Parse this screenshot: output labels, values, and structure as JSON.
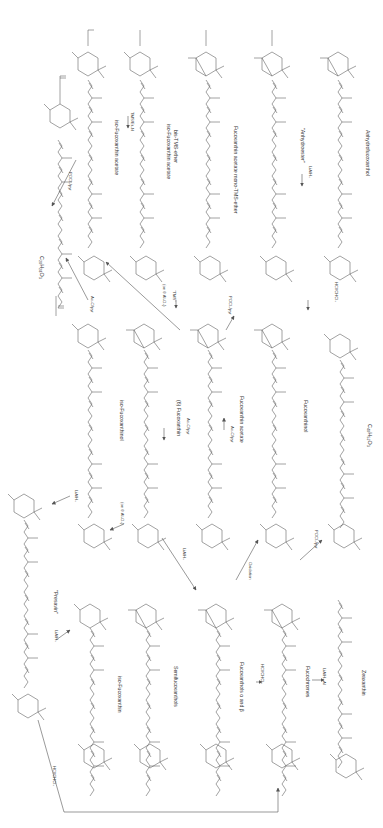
{
  "diagram": {
    "type": "reaction-scheme",
    "orientation": "rotated-90-clockwise",
    "columns": [
      {
        "x": 95,
        "compounds": [
          {
            "id": "c20h28o3",
            "name": "C20H28O3",
            "top_group": "O-C(=O)-CH3",
            "end_group": "H3C-C(=O)-O"
          },
          {
            "id": "presavin",
            "name": "\"Presavin\"",
            "substituents": [
              "OH",
              "OH",
              "OH"
            ]
          },
          {
            "id": "iso-fucoxanthin",
            "name": "iso-Fucoxanthin",
            "substituents": [
              "HO",
              "OH"
            ]
          }
        ]
      }
    ],
    "compounds": [
      {
        "id": "iso-fucoxanthin-acetate",
        "label": "iso-Fucoxanthin acetate",
        "groups": [
          "OH",
          "O-C(=O)-CH3",
          "H3C-C(=O)-O",
          "OH"
        ]
      },
      {
        "id": "iso-fucoxanthin-acetate-bis-tms",
        "label": "iso-Fucoxanthin acetate bis-TMS-ether",
        "groups": [
          "TMSO",
          "O-C(=O)-CH3",
          "H3C-C(=O)-O",
          "OTMS"
        ]
      },
      {
        "id": "fucoxanthin-acetate-mono-tms",
        "label": "Fucoxanthin acetate mono-TMS-ether",
        "groups": [
          "O-C(=O)-CH3",
          "H3C-C(=O)-O",
          "OTMS"
        ]
      },
      {
        "id": "anhydroester",
        "label": "\"Anhydroester\"",
        "groups": [
          "O-C(=O)-CH3",
          "H3C-C(=O)-O"
        ]
      },
      {
        "id": "anhydrofucoxanthol",
        "label": "Anhydrofucoxanthol",
        "groups": [
          "OH",
          "HO",
          "HO"
        ]
      },
      {
        "id": "c20h28o3",
        "label": "C20H28O3",
        "groups": [
          "O-C(=O)-CH3",
          "H3C-C(=O)-O"
        ]
      },
      {
        "id": "iso-fucoxanthinol",
        "label": "iso-Fucoxanthinol",
        "groups": [
          "OH",
          "OH",
          "H3C-C(=O)-O",
          "OH"
        ]
      },
      {
        "id": "fucoxanthin",
        "label": "(6) Fucoxanthin",
        "groups": [
          "OH",
          "H3C-C(=O)-O",
          "OH"
        ]
      },
      {
        "id": "fucoxanthin-acetate",
        "label": "Fucoxanthin acetate",
        "groups": [
          "O-C(=O)-CH3",
          "H3C-C(=O)-O",
          "OH"
        ]
      },
      {
        "id": "fucoxanthinol",
        "label": "Fucoxanthinol",
        "groups": [
          "OH",
          "H3C-C(=O)-O",
          "OH"
        ]
      },
      {
        "id": "c40h52o3",
        "label": "C40H52O3",
        "groups": [
          "OHC",
          "HO"
        ]
      },
      {
        "id": "presavin",
        "label": "\"Presavin\"",
        "groups": [
          "OH",
          "OH",
          "OH",
          "HO",
          "OH"
        ]
      },
      {
        "id": "iso-fucoxanthin",
        "label": "iso-Fucoxanthin",
        "groups": [
          "HO",
          "OH",
          "H3C-C(=O)-O",
          "OH"
        ]
      },
      {
        "id": "semifucoxanthols",
        "label": "Semifucoxanthols",
        "groups": [
          "OH",
          "HO",
          "H3C-C(=O)-O",
          "OH"
        ]
      },
      {
        "id": "fucoxanthols",
        "label": "Fucoxanthols α and β",
        "groups": [
          "OH",
          "HO",
          "HO",
          "OH"
        ]
      },
      {
        "id": "fucochromes",
        "label": "Fucochromes",
        "groups": [
          "OH",
          "HO",
          "OH"
        ]
      },
      {
        "id": "zeaxanthin",
        "label": "Zeaxanthin",
        "groups": [
          "HO",
          "OH"
        ]
      }
    ],
    "reagents": [
      {
        "id": "r1",
        "label": "POCl3/pyr",
        "from": "iso-fucoxanthin-acetate",
        "to": "c20h28o3"
      },
      {
        "id": "r2",
        "label": "Ac2O/pyr",
        "from": "iso-fucoxanthinol",
        "to": "c20h28o3"
      },
      {
        "id": "r3",
        "label": "TMS/Et3N",
        "from": "iso-fucoxanthin-acetate",
        "to": "iso-fucoxanthin-acetate-bis-tms"
      },
      {
        "id": "r4",
        "label": "Ac2O/pyr",
        "from": "fucoxanthin",
        "to": "fucoxanthin-acetate"
      },
      {
        "id": "r5",
        "label": "(on θ Al2O3)",
        "from": "fucoxanthin-acetate",
        "to": "iso-fucoxanthin-acetate"
      },
      {
        "id": "r6",
        "label": "TMS",
        "from": "fucoxanthin-acetate",
        "to": "fucoxanthin-acetate-mono-tms"
      },
      {
        "id": "r7",
        "label": "Ac2O/pyr",
        "from": "fucoxanthinol",
        "to": "fucoxanthin-acetate"
      },
      {
        "id": "r8",
        "label": "POCl3/pyr",
        "from": "fucoxanthin-acetate",
        "to": "anhydroester"
      },
      {
        "id": "r9",
        "label": "LiAlH4",
        "from": "anhydroester",
        "to": "anhydrofucoxanthol"
      },
      {
        "id": "r10",
        "label": "HCl/CHCl3",
        "from": "fucoxanthinol",
        "to": "c40h52o3"
      },
      {
        "id": "r11",
        "label": "LiAlH4",
        "from": "iso-fucoxanthinol",
        "to": "presavin"
      },
      {
        "id": "r12",
        "label": "(on θ Al2O3)",
        "from": "fucoxanthin",
        "to": "iso-fucoxanthin"
      },
      {
        "id": "r13",
        "label": "LiAlH4",
        "from": "iso-fucoxanthin",
        "to": "presavin"
      },
      {
        "id": "r14",
        "label": "LiAlH4",
        "from": "fucoxanthin",
        "to": "fucoxanthols"
      },
      {
        "id": "r15",
        "label": "Oxidation",
        "from": "fucoxanthols",
        "to": "fucoxanthinol"
      },
      {
        "id": "r16",
        "label": "POCl3/pyr",
        "from": "fucochromes",
        "to": "fucoxanthinol"
      },
      {
        "id": "r17",
        "label": "HCl/CHCl3",
        "from": "fucoxanthols",
        "to": "fucochromes"
      },
      {
        "id": "r18",
        "label": "LiAlH4,Al",
        "from": "fucochromes",
        "to": "zeaxanthin"
      },
      {
        "id": "r19",
        "label": "HCl/CHCl3",
        "from": "iso-fucoxanthin",
        "to": "fucochromes"
      }
    ],
    "labels": {
      "iso_fucoxanthin_acetate": "iso-Fucoxanthin acetate",
      "iso_fucoxanthin_acetate_bis_tms": "iso-Fucoxanthin acetate",
      "bis_tms_ether": "bis-TMS-ether",
      "fucoxanthin_acetate_mono_tms": "Fucoxanthin acetate   mono-TMS-ether",
      "anhydroester": "\"Anhydroester\"",
      "anhydrofucoxanthol": "Anhydrofucoxanthol",
      "c20h28o3": "C₂₀H₂₈O₃",
      "iso_fucoxanthinol": "iso-Fucoxanthinol",
      "fucoxanthin": "(6)  Fucoxanthin",
      "fucoxanthin_acetate": "Fucoxanthin acetate",
      "fucoxanthinol": "Fucoxanthinol",
      "c40h52o3": "C₄₀H₅₂O₃",
      "presavin": "\"Presavin\"",
      "iso_fucoxanthin": "iso-Fucoxanthin",
      "semifucoxanthols": "Semifucoxanthols",
      "fucoxanthols": "Fucoxanthols α and β",
      "fucochromes": "Fucochromes",
      "zeaxanthin": "Zeaxanthin"
    },
    "reagent_labels": {
      "pocl3_top": "POCl₃/pyr",
      "tms_et3n": "TMS/Et₃N",
      "ac2o_1": "Ac₂O/pyr",
      "on_al2o3_1": "(on θ Al₂O₃)",
      "tms": "\"TMS\"",
      "ac2o_2": "Ac₂O/pyr",
      "ac2o_3": "Ac₂O/pyr",
      "pocl3_2": "POCl₃/pyr",
      "lialh4_1": "LiAlH₄",
      "hcl_1": "HCl/CHCl₃",
      "lialh4_2": "LiAlH₄",
      "on_al2o3_2": "(on θ Al₂O₃)",
      "lialh4_3": "LiAlH₄",
      "lialh4_4": "LiAlH₄",
      "oxidation": "Oxidation",
      "pocl3_3": "POCl₃/pyr",
      "hcl_2": "HCl/CHCl₃",
      "lialh4_al": "LiAlH₄,Al",
      "hcl_3": "HCl/CHCl₃"
    },
    "atoms": {
      "oh": "OH",
      "ho": "HO",
      "o": "O",
      "ch3": "CH₃",
      "c": "C",
      "h3c": "H₃C",
      "tmso": "TMSO",
      "otms": "OTMS",
      "ohc": "OHC"
    }
  }
}
